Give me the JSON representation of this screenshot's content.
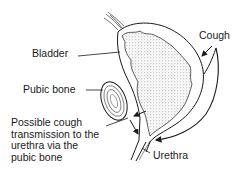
{
  "diagram": {
    "type": "anatomical-illustration",
    "labels": {
      "bladder": "Bladder",
      "pubic_bone": "Pubic bone",
      "cough": "Cough",
      "urethra": "Urethra",
      "possible_line1": "Possible cough",
      "possible_line2": "transmission to the",
      "possible_line3": "urethra via the",
      "possible_line4": "pubic bone"
    },
    "colors": {
      "ink": "#1a1a1a",
      "stipple": "#9a9a9a",
      "background": "#ffffff"
    }
  }
}
